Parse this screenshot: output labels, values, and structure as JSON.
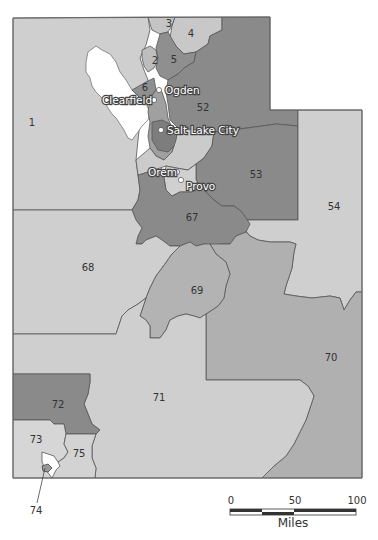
{
  "map": {
    "title": "Utah regions",
    "colors": {
      "light": "#cfcfcf",
      "lighter": "#d6d6d6",
      "medium": "#b3b3b3",
      "dark": "#8a8a8a",
      "lake": "#ffffff",
      "border": "#555555"
    },
    "regions": [
      {
        "id": "1",
        "label": "1"
      },
      {
        "id": "2",
        "label": "2"
      },
      {
        "id": "3",
        "label": "3"
      },
      {
        "id": "4",
        "label": "4"
      },
      {
        "id": "5",
        "label": "5"
      },
      {
        "id": "6",
        "label": "6"
      },
      {
        "id": "52",
        "label": "52"
      },
      {
        "id": "53",
        "label": "53"
      },
      {
        "id": "54",
        "label": "54"
      },
      {
        "id": "67",
        "label": "67"
      },
      {
        "id": "68",
        "label": "68"
      },
      {
        "id": "69",
        "label": "69"
      },
      {
        "id": "70",
        "label": "70"
      },
      {
        "id": "71",
        "label": "71"
      },
      {
        "id": "72",
        "label": "72"
      },
      {
        "id": "73",
        "label": "73"
      },
      {
        "id": "74",
        "label": "74"
      },
      {
        "id": "75",
        "label": "75"
      }
    ],
    "cities": [
      {
        "name": "Ogden"
      },
      {
        "name": "Clearfield"
      },
      {
        "name": "Salt Lake City"
      },
      {
        "name": "Orem"
      },
      {
        "name": "Provo"
      }
    ]
  },
  "scale_bar": {
    "ticks": [
      "0",
      "50",
      "100"
    ],
    "unit": "Miles"
  }
}
